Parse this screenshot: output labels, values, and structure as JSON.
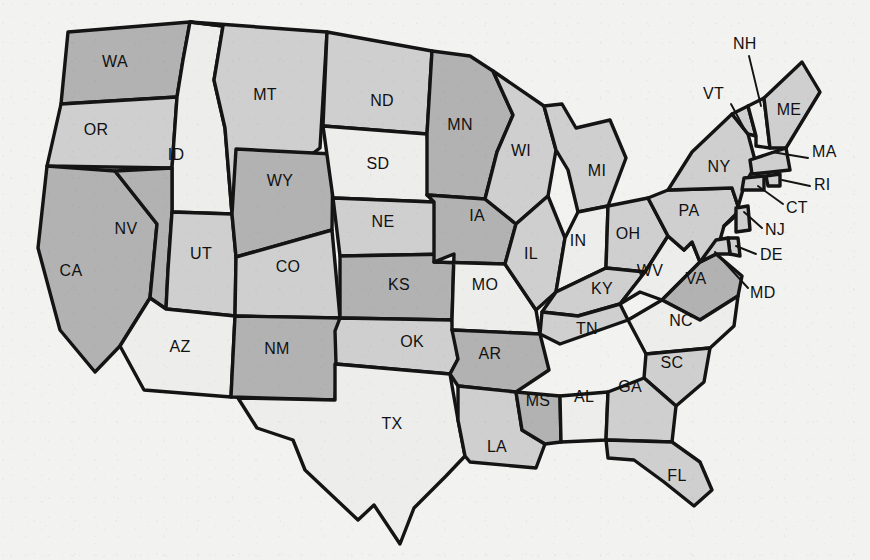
{
  "figure": {
    "kind": "choropleth-map",
    "background_color": "#f2f2f0",
    "outline_color": "#141414"
  },
  "legend_shades": {
    "dark": "#b2b2b2",
    "mid": "#cfcfcf",
    "light": "#ededeb"
  },
  "states": [
    {
      "code": "WA",
      "shade": "dark",
      "label_x": 115,
      "label_y": 63,
      "path": "M68,32 L190,22 L183,60 L177,97 L61,104 Z"
    },
    {
      "code": "OR",
      "shade": "mid",
      "label_x": 96,
      "label_y": 131,
      "path": "M61,104 L177,97 L172,168 L47,166 Z"
    },
    {
      "code": "ID",
      "shade": "light",
      "label_x": 176,
      "label_y": 156,
      "path": "M190,22 L223,26 L214,80 L225,128 L232,214 L172,212 L172,168 L177,97 L183,60 Z"
    },
    {
      "code": "CA",
      "shade": "dark",
      "label_x": 71,
      "label_y": 272,
      "path": "M47,166 L115,171 L157,224 L150,298 L120,346 L95,372 L60,330 L38,248 Z"
    },
    {
      "code": "NV",
      "shade": "dark",
      "label_x": 126,
      "label_y": 230,
      "path": "M115,171 L172,168 L172,212 L168,270 L166,309 L150,298 L157,224 Z"
    },
    {
      "code": "UT",
      "shade": "mid",
      "label_x": 201,
      "label_y": 255,
      "path": "M172,212 L232,214 L236,257 L235,316 L166,309 L168,270 Z"
    },
    {
      "code": "AZ",
      "shade": "light",
      "label_x": 180,
      "label_y": 348,
      "path": "M166,309 L235,316 L231,397 L144,390 L120,346 L150,298 Z"
    },
    {
      "code": "MT",
      "shade": "mid",
      "label_x": 265,
      "label_y": 96,
      "path": "M190,22 L327,32 L320,148 L232,214 L225,128 L214,80 L223,26 Z"
    },
    {
      "code": "WY",
      "shade": "dark",
      "label_x": 280,
      "label_y": 182,
      "path": "M236,149 L333,154 L332,230 L236,257 L232,214 Z"
    },
    {
      "code": "CO",
      "shade": "mid",
      "label_x": 288,
      "label_y": 268,
      "path": "M236,257 L332,230 L340,318 L235,316 Z"
    },
    {
      "code": "NM",
      "shade": "dark",
      "label_x": 277,
      "label_y": 350,
      "path": "M235,316 L340,318 L335,400 L231,397 Z"
    },
    {
      "code": "ND",
      "shade": "mid",
      "label_x": 382,
      "label_y": 102,
      "path": "M327,32 L432,51 L427,134 L323,126 Z"
    },
    {
      "code": "SD",
      "shade": "light",
      "label_x": 378,
      "label_y": 165,
      "path": "M323,126 L427,134 L434,202 L333,198 Z"
    },
    {
      "code": "NE",
      "shade": "mid",
      "label_x": 383,
      "label_y": 223,
      "path": "M333,198 L434,202 L454,254 L340,256 Z"
    },
    {
      "code": "KS",
      "shade": "dark",
      "label_x": 399,
      "label_y": 286,
      "path": "M340,256 L454,254 L452,320 L340,318 Z"
    },
    {
      "code": "OK",
      "shade": "mid",
      "label_x": 412,
      "label_y": 343,
      "path": "M340,318 L452,320 L458,359 L450,374 L336,364 L335,331 Z"
    },
    {
      "code": "TX",
      "shade": "light",
      "label_x": 392,
      "label_y": 425,
      "path": "M335,400 L335,364 L450,374 L458,420 L465,456 L446,476 L414,508 L400,544 L374,505 L358,520 L305,470 L293,440 L257,428 L238,398 Z"
    },
    {
      "code": "MN",
      "shade": "dark",
      "label_x": 460,
      "label_y": 126,
      "path": "M432,51 L470,56 L493,71 L513,115 L497,152 L485,199 L427,195 L427,134 Z"
    },
    {
      "code": "IA",
      "shade": "dark",
      "label_x": 477,
      "label_y": 217,
      "path": "M427,195 L485,199 L516,224 L505,264 L434,262 L434,202 Z"
    },
    {
      "code": "MO",
      "shade": "light",
      "label_x": 485,
      "label_y": 286,
      "path": "M434,262 L505,264 L536,310 L540,334 L452,330 L452,320 L454,254 Z"
    },
    {
      "code": "AR",
      "shade": "dark",
      "label_x": 490,
      "label_y": 355,
      "path": "M452,330 L540,334 L549,370 L516,392 L458,386 L450,374 L458,359 Z"
    },
    {
      "code": "LA",
      "shade": "mid",
      "label_x": 497,
      "label_y": 448,
      "path": "M458,386 L516,392 L522,430 L545,444 L536,468 L470,462 L465,456 L458,420 Z"
    },
    {
      "code": "MS",
      "shade": "dark",
      "label_x": 538,
      "label_y": 402,
      "path": "M516,392 L560,396 L561,442 L545,444 L522,430 Z"
    },
    {
      "code": "AL",
      "shade": "light",
      "label_x": 584,
      "label_y": 398,
      "path": "M560,396 L608,392 L606,440 L561,442 Z"
    },
    {
      "code": "WI",
      "shade": "mid",
      "label_x": 521,
      "label_y": 152,
      "path": "M493,71 L544,106 L556,150 L548,196 L516,224 L485,199 L497,152 L513,115 Z"
    },
    {
      "code": "IL",
      "shade": "mid",
      "label_x": 531,
      "label_y": 255,
      "path": "M516,224 L548,196 L565,238 L556,292 L536,310 L505,264 Z"
    },
    {
      "code": "MI",
      "shade": "mid",
      "label_x": 597,
      "label_y": 172,
      "path": "M562,104 L576,128 L610,120 L626,158 L608,206 L578,212 L568,170 L556,150 L544,106 Z"
    },
    {
      "code": "IN",
      "shade": "light",
      "label_x": 578,
      "label_y": 242,
      "path": "M565,238 L578,212 L608,206 L606,268 L556,292 Z"
    },
    {
      "code": "OH",
      "shade": "mid",
      "label_x": 628,
      "label_y": 235,
      "path": "M608,206 L648,198 L668,236 L645,272 L606,268 Z"
    },
    {
      "code": "KY",
      "shade": "mid",
      "label_x": 602,
      "label_y": 290,
      "path": "M556,292 L606,268 L645,272 L620,304 L578,316 L542,312 Z"
    },
    {
      "code": "TN",
      "shade": "mid",
      "label_x": 587,
      "label_y": 330,
      "path": "M540,334 L542,312 L578,316 L620,304 L628,320 L560,344 Z"
    },
    {
      "code": "WV",
      "shade": "light",
      "label_x": 650,
      "label_y": 272,
      "path": "M645,272 L668,236 L684,250 L692,242 L700,262 L676,286 L662,300 L640,292 L620,304 Z"
    },
    {
      "code": "VA",
      "shade": "dark",
      "label_x": 696,
      "label_y": 280,
      "path": "M676,286 L700,262 L716,254 L742,276 L738,296 L700,320 L662,300 Z"
    },
    {
      "code": "NC",
      "shade": "light",
      "label_x": 681,
      "label_y": 322,
      "path": "M628,320 L662,300 L700,320 L738,296 L734,326 L710,348 L646,354 Z"
    },
    {
      "code": "SC",
      "shade": "mid",
      "label_x": 672,
      "label_y": 364,
      "path": "M646,354 L710,348 L704,382 L676,406 L644,378 Z"
    },
    {
      "code": "GA",
      "shade": "mid",
      "label_x": 630,
      "label_y": 388,
      "path": "M608,392 L644,378 L676,406 L672,442 L606,440 Z"
    },
    {
      "code": "FL",
      "shade": "mid",
      "label_x": 677,
      "label_y": 477,
      "path": "M606,440 L672,442 L700,462 L712,490 L694,506 L664,482 L634,460 L608,458 Z"
    },
    {
      "code": "PA",
      "shade": "mid",
      "label_x": 689,
      "label_y": 212,
      "path": "M648,198 L668,190 L732,188 L740,212 L724,226 L716,254 L700,262 L692,242 L684,250 L668,236 Z"
    },
    {
      "code": "NY",
      "shade": "mid",
      "label_x": 719,
      "label_y": 168,
      "path": "M668,190 L692,152 L732,114 L748,134 L756,164 L744,186 L736,214 L724,226 L740,212 L732,188 Z"
    },
    {
      "code": "VT",
      "shade": "mid",
      "label_x": 746,
      "label_y": 130,
      "path": "M732,114 L748,106 L756,136 L748,134 Z"
    },
    {
      "code": "NH",
      "shade": "light",
      "label_x": 762,
      "label_y": 130,
      "path": "M748,106 L764,98 L770,148 L756,146 L756,136 Z"
    },
    {
      "code": "ME",
      "shade": "mid",
      "label_x": 789,
      "label_y": 111,
      "path": "M764,98 L802,62 L820,92 L786,148 L770,148 Z"
    },
    {
      "code": "MA",
      "shade": "mid",
      "label_x": 757,
      "label_y": 163,
      "path": "M750,160 L786,148 L790,170 L752,174 Z"
    },
    {
      "code": "RI",
      "shade": "mid",
      "label_x": 768,
      "label_y": 180,
      "path": "M766,176 L780,174 L780,186 L768,186 Z"
    },
    {
      "code": "CT",
      "shade": "mid",
      "label_x": 751,
      "label_y": 182,
      "path": "M744,178 L764,176 L764,190 L742,190 Z"
    },
    {
      "code": "NJ",
      "shade": "mid",
      "label_x": 736,
      "label_y": 222,
      "path": "M736,208 L748,206 L750,230 L736,232 Z"
    },
    {
      "code": "DE",
      "shade": "mid",
      "label_x": 732,
      "label_y": 248,
      "path": "M728,238 L738,238 L740,256 L730,254 Z"
    },
    {
      "code": "MD",
      "shade": "mid",
      "label_x": 714,
      "label_y": 256,
      "path": "M700,262 L716,240 L728,238 L730,254 L716,254 Z"
    }
  ],
  "callouts": [
    {
      "code": "NH",
      "text_x": 733,
      "text_y": 45,
      "leader": "M749,56 L761,106"
    },
    {
      "code": "VT",
      "text_x": 703,
      "text_y": 95,
      "leader": "M731,104 L745,130"
    },
    {
      "code": "MA",
      "text_x": 812,
      "text_y": 153,
      "leader": "M808,158 L772,152"
    },
    {
      "code": "RI",
      "text_x": 814,
      "text_y": 186,
      "leader": "M810,186 L782,180"
    },
    {
      "code": "CT",
      "text_x": 786,
      "text_y": 209,
      "leader": "M783,204 L758,186"
    },
    {
      "code": "NJ",
      "text_x": 765,
      "text_y": 231,
      "leader": "M762,228 L744,212"
    },
    {
      "code": "DE",
      "text_x": 760,
      "text_y": 256,
      "leader": "M756,254 L736,246"
    },
    {
      "code": "MD",
      "text_x": 750,
      "text_y": 294,
      "leader": "M748,288 L715,252"
    }
  ]
}
